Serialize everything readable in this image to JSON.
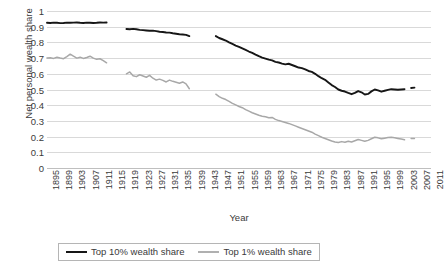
{
  "chart_data": {
    "type": "line",
    "title": "",
    "xlabel": "Year",
    "ylabel": "Net personal wealth share",
    "xlim": [
      1895,
      2011
    ],
    "ylim": [
      0,
      1
    ],
    "grid": true,
    "legend_position": "bottom",
    "y_ticks": [
      "0",
      "0.1",
      "0.2",
      "0.3",
      "0.4",
      "0.5",
      "0.6",
      "0.7",
      "0.8",
      "0.9",
      "1"
    ],
    "x_tick_labels": [
      "1895",
      "1899",
      "1903",
      "1907",
      "1911",
      "1915",
      "1919",
      "1923",
      "1927",
      "1931",
      "1935",
      "1939",
      "1943",
      "1947",
      "1951",
      "1955",
      "1959",
      "1963",
      "1967",
      "1971",
      "1975",
      "1979",
      "1983",
      "1987",
      "1991",
      "1995",
      "1999",
      "2003",
      "2007",
      "2011"
    ],
    "colors": {
      "top10": "#161616",
      "top1": "#a8a8a8",
      "gridline": "#d9d9d9"
    },
    "series": [
      {
        "name": "Top 10% wealth share",
        "color": "#161616",
        "segments": [
          {
            "x": [
              1895,
              1896,
              1897,
              1898,
              1899,
              1900,
              1901,
              1902,
              1903,
              1904,
              1905,
              1906,
              1907,
              1908,
              1909,
              1910,
              1911,
              1912,
              1913
            ],
            "y": [
              0.925,
              0.924,
              0.926,
              0.925,
              0.923,
              0.924,
              0.926,
              0.925,
              0.926,
              0.927,
              0.925,
              0.924,
              0.926,
              0.925,
              0.924,
              0.925,
              0.927,
              0.926,
              0.927
            ]
          },
          {
            "x": [
              1919,
              1920,
              1921,
              1922,
              1923,
              1924,
              1925,
              1926,
              1927,
              1928,
              1929,
              1930,
              1931,
              1932,
              1933,
              1934,
              1935,
              1936,
              1937,
              1938
            ],
            "y": [
              0.885,
              0.884,
              0.886,
              0.884,
              0.88,
              0.878,
              0.876,
              0.874,
              0.875,
              0.872,
              0.868,
              0.866,
              0.863,
              0.862,
              0.858,
              0.855,
              0.852,
              0.85,
              0.848,
              0.84
            ]
          },
          {
            "x": [
              1946,
              1947,
              1948,
              1949,
              1950,
              1951,
              1952,
              1953,
              1954,
              1955,
              1956,
              1957,
              1958,
              1959,
              1960,
              1961,
              1962,
              1963,
              1964,
              1965,
              1966,
              1967,
              1968,
              1969,
              1970,
              1971,
              1972,
              1973,
              1974,
              1975,
              1976,
              1977,
              1978,
              1979,
              1980,
              1981,
              1982,
              1983,
              1984,
              1985,
              1986,
              1987,
              1988,
              1989,
              1990,
              1991,
              1992,
              1993,
              1994,
              1995,
              1996,
              1997,
              1998,
              1999,
              2000,
              2001,
              2002,
              2003
            ],
            "y": [
              0.84,
              0.828,
              0.82,
              0.812,
              0.8,
              0.79,
              0.78,
              0.772,
              0.762,
              0.752,
              0.742,
              0.733,
              0.722,
              0.712,
              0.703,
              0.697,
              0.69,
              0.685,
              0.676,
              0.672,
              0.665,
              0.66,
              0.664,
              0.656,
              0.648,
              0.64,
              0.636,
              0.628,
              0.618,
              0.612,
              0.6,
              0.585,
              0.572,
              0.562,
              0.545,
              0.528,
              0.516,
              0.5,
              0.492,
              0.487,
              0.478,
              0.47,
              0.478,
              0.49,
              0.482,
              0.468,
              0.472,
              0.488,
              0.5,
              0.494,
              0.486,
              0.492,
              0.498,
              0.502,
              0.5,
              0.498,
              0.5,
              0.502
            ]
          },
          {
            "x": [
              2005,
              2006
            ],
            "y": [
              0.51,
              0.512
            ]
          }
        ]
      },
      {
        "name": "Top 1% wealth share",
        "color": "#a8a8a8",
        "segments": [
          {
            "x": [
              1895,
              1896,
              1897,
              1898,
              1899,
              1900,
              1901,
              1902,
              1903,
              1904,
              1905,
              1906,
              1907,
              1908,
              1909,
              1910,
              1911,
              1912,
              1913
            ],
            "y": [
              0.7,
              0.702,
              0.698,
              0.705,
              0.7,
              0.696,
              0.71,
              0.725,
              0.712,
              0.7,
              0.706,
              0.698,
              0.704,
              0.712,
              0.7,
              0.692,
              0.696,
              0.684,
              0.67
            ]
          },
          {
            "x": [
              1919,
              1920,
              1921,
              1922,
              1923,
              1924,
              1925,
              1926,
              1927,
              1928,
              1929,
              1930,
              1931,
              1932,
              1933,
              1934,
              1935,
              1936,
              1937,
              1938
            ],
            "y": [
              0.6,
              0.612,
              0.588,
              0.582,
              0.594,
              0.586,
              0.578,
              0.59,
              0.572,
              0.56,
              0.566,
              0.558,
              0.548,
              0.56,
              0.552,
              0.546,
              0.54,
              0.548,
              0.536,
              0.505
            ]
          },
          {
            "x": [
              1946,
              1947,
              1948,
              1949,
              1950,
              1951,
              1952,
              1953,
              1954,
              1955,
              1956,
              1957,
              1958,
              1959,
              1960,
              1961,
              1962,
              1963,
              1964,
              1965,
              1966,
              1967,
              1968,
              1969,
              1970,
              1971,
              1972,
              1973,
              1974,
              1975,
              1976,
              1977,
              1978,
              1979,
              1980,
              1981,
              1982,
              1983,
              1984,
              1985,
              1986,
              1987,
              1988,
              1989,
              1990,
              1991,
              1992,
              1993,
              1994,
              1995,
              1996,
              1997,
              1998,
              1999,
              2000,
              2001,
              2002,
              2003
            ],
            "y": [
              0.47,
              0.455,
              0.444,
              0.436,
              0.424,
              0.412,
              0.402,
              0.392,
              0.384,
              0.372,
              0.362,
              0.352,
              0.344,
              0.336,
              0.33,
              0.326,
              0.32,
              0.322,
              0.31,
              0.302,
              0.296,
              0.29,
              0.284,
              0.276,
              0.268,
              0.26,
              0.252,
              0.244,
              0.236,
              0.228,
              0.216,
              0.206,
              0.196,
              0.188,
              0.18,
              0.172,
              0.166,
              0.162,
              0.168,
              0.164,
              0.17,
              0.166,
              0.174,
              0.182,
              0.176,
              0.17,
              0.176,
              0.186,
              0.196,
              0.192,
              0.186,
              0.19,
              0.194,
              0.196,
              0.192,
              0.188,
              0.184,
              0.18
            ]
          },
          {
            "x": [
              2005,
              2006
            ],
            "y": [
              0.188,
              0.188
            ]
          }
        ]
      }
    ]
  },
  "legend": {
    "items": [
      {
        "label": "Top 10% wealth share",
        "color": "#161616"
      },
      {
        "label": "Top 1% wealth share",
        "color": "#a8a8a8"
      }
    ]
  }
}
